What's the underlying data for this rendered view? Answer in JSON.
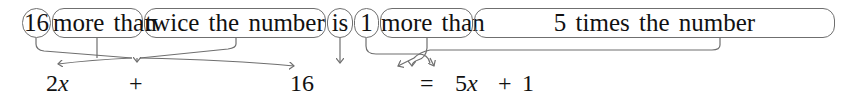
{
  "sentence": {
    "phrases": [
      {
        "id": "p1",
        "text": "16",
        "shape": "circle"
      },
      {
        "id": "p2",
        "text": "more than",
        "shape": "rounded-box"
      },
      {
        "id": "p3",
        "text": "twice the number",
        "shape": "rounded-box"
      },
      {
        "id": "p4",
        "text": "is",
        "shape": "circle"
      },
      {
        "id": "p5",
        "text": "1",
        "shape": "circle"
      },
      {
        "id": "p6",
        "text": "more than",
        "shape": "rounded-box"
      },
      {
        "id": "p7",
        "text": "5 times the number",
        "shape": "rounded-box"
      }
    ]
  },
  "equation": {
    "left_term": "2",
    "left_var": "x",
    "plus1": "+",
    "const1": "16",
    "equals": "=",
    "right_coef": "5",
    "right_var": "x",
    "plus2": "+",
    "const2": "1"
  },
  "colors": {
    "box_stroke": "#6f6f6f",
    "arrow_stroke": "#6f6f6f",
    "text": "#111111"
  }
}
